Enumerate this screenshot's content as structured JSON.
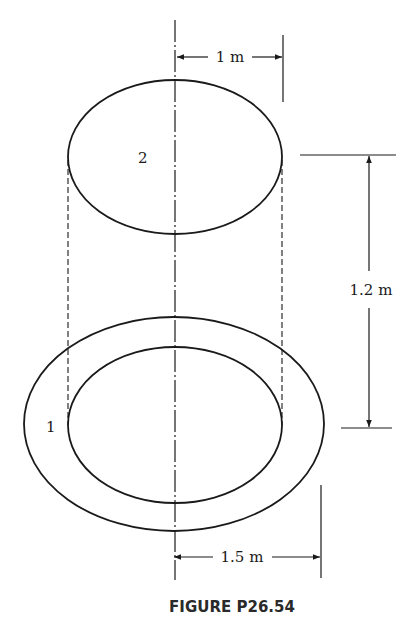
{
  "figure": {
    "caption": "FIGURE P26.54",
    "surfaces": [
      {
        "id": "surface-1",
        "label": "1",
        "description": "annular ring (bottom)"
      },
      {
        "id": "surface-2",
        "label": "2",
        "description": "disk (top)"
      }
    ],
    "dimensions": {
      "top_disk_radius": "1 m",
      "separation": "1.2 m",
      "outer_ring_radius": "1.5 m"
    }
  }
}
